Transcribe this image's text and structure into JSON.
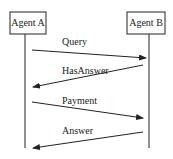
{
  "diagram": {
    "type": "sequence",
    "participants": [
      {
        "id": "A",
        "label": "Agent A",
        "box": {
          "x": 10,
          "y": 12,
          "w": 36,
          "h": 22
        },
        "lifeline_x": 25
      },
      {
        "id": "B",
        "label": "Agent B",
        "box": {
          "x": 127,
          "y": 12,
          "w": 38,
          "h": 22
        },
        "lifeline_x": 149
      }
    ],
    "lifeline_end_y": 148,
    "messages": [
      {
        "label": "Query",
        "from": "A",
        "to": "B",
        "x1": 32,
        "y1": 50,
        "x2": 146,
        "y2": 58,
        "lx": 62,
        "ly": 45
      },
      {
        "label": "HasAnswer",
        "from": "B",
        "to": "A",
        "x1": 143,
        "y1": 65,
        "x2": 33,
        "y2": 87,
        "lx": 62,
        "ly": 74
      },
      {
        "label": "Payment",
        "from": "A",
        "to": "B",
        "x1": 32,
        "y1": 102,
        "x2": 143,
        "y2": 118,
        "lx": 62,
        "ly": 104
      },
      {
        "label": "Answer",
        "from": "B",
        "to": "A",
        "x1": 143,
        "y1": 132,
        "x2": 33,
        "y2": 148,
        "lx": 62,
        "ly": 134
      }
    ],
    "colors": {
      "line": "#222222",
      "text": "#222222",
      "background": "#ffffff"
    }
  }
}
